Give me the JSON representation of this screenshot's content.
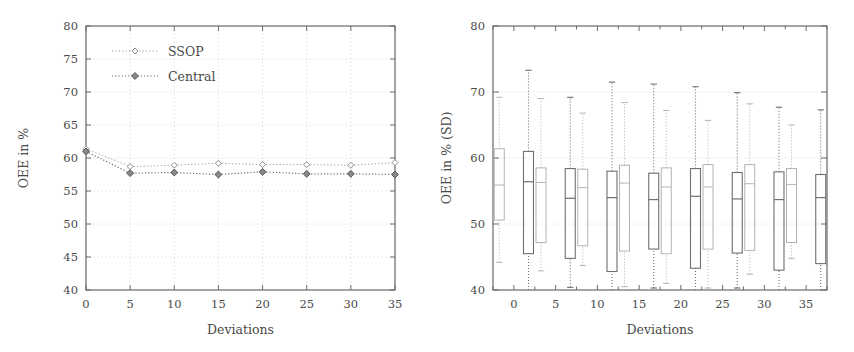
{
  "figure": {
    "background": "#ffffff",
    "panel_count": 2
  },
  "chart_data": [
    {
      "panel": "left",
      "type": "line",
      "title": "",
      "xlabel": "Deviations",
      "ylabel": "OEE in %",
      "x": [
        0,
        5,
        10,
        15,
        20,
        25,
        30,
        35
      ],
      "xticklabels": [
        "0",
        "5",
        "10",
        "15",
        "20",
        "25",
        "30",
        "35"
      ],
      "xlim": [
        0,
        35
      ],
      "ylim": [
        40,
        80
      ],
      "yticks": [
        40,
        45,
        50,
        55,
        60,
        65,
        70,
        75,
        80
      ],
      "yticklabels": [
        "40",
        "45",
        "50",
        "55",
        "60",
        "65",
        "70",
        "75",
        "80"
      ],
      "grid": true,
      "grid_style": "dotted",
      "legend_position": "upper-left",
      "series": [
        {
          "name": "SSOP",
          "color": "#9a9a96",
          "marker": "open-diamond",
          "values": [
            61.4,
            58.7,
            58.9,
            59.2,
            59.0,
            59.0,
            58.9,
            59.3
          ]
        },
        {
          "name": "Central",
          "color": "#6e6e6a",
          "marker": "filled-diamond",
          "values": [
            61.0,
            57.7,
            57.8,
            57.5,
            57.9,
            57.6,
            57.6,
            57.5
          ]
        }
      ]
    },
    {
      "panel": "right",
      "type": "boxplot",
      "title": "",
      "xlabel": "Deviations",
      "ylabel": "OEE in % (SD)",
      "categories": [
        "0",
        "5",
        "10",
        "15",
        "20",
        "25",
        "30",
        "35"
      ],
      "xlim": [
        -2.5,
        37.5
      ],
      "ylim": [
        40,
        80
      ],
      "yticks": [
        40,
        50,
        60,
        70,
        80
      ],
      "yticklabels": [
        "40",
        "50",
        "60",
        "70",
        "80"
      ],
      "grid": true,
      "grid_style": "dotted",
      "series": [
        {
          "name": "SSOP",
          "color": "#b4b4af",
          "boxes": [
            {
              "category": "0",
              "whisker_low": 44.2,
              "q1": 50.6,
              "median": 55.9,
              "q3": 61.4,
              "whisker_high": 69.2
            },
            {
              "category": "5",
              "whisker_low": 42.9,
              "q1": 47.2,
              "median": 56.3,
              "q3": 58.5,
              "whisker_high": 69.0
            },
            {
              "category": "10",
              "whisker_low": 43.7,
              "q1": 46.7,
              "median": 55.5,
              "q3": 58.3,
              "whisker_high": 66.8
            },
            {
              "category": "15",
              "whisker_low": 40.5,
              "q1": 45.9,
              "median": 56.2,
              "q3": 58.9,
              "whisker_high": 68.4
            },
            {
              "category": "20",
              "whisker_low": 41.0,
              "q1": 45.5,
              "median": 55.6,
              "q3": 58.5,
              "whisker_high": 67.2
            },
            {
              "category": "25",
              "whisker_low": 40.3,
              "q1": 46.2,
              "median": 55.6,
              "q3": 59.0,
              "whisker_high": 65.7
            },
            {
              "category": "30",
              "whisker_low": 42.4,
              "q1": 46.0,
              "median": 56.1,
              "q3": 59.0,
              "whisker_high": 68.2
            },
            {
              "category": "35",
              "whisker_low": 44.8,
              "q1": 47.2,
              "median": 56.0,
              "q3": 58.4,
              "whisker_high": 65.0
            }
          ]
        },
        {
          "name": "Central",
          "color": "#6f6f6b",
          "boxes": [
            {
              "category": "0",
              "whisker_low": 40.0,
              "q1": 45.5,
              "median": 56.4,
              "q3": 61.0,
              "whisker_high": 73.3
            },
            {
              "category": "5",
              "whisker_low": 40.4,
              "q1": 44.8,
              "median": 53.9,
              "q3": 58.4,
              "whisker_high": 69.2
            },
            {
              "category": "10",
              "whisker_low": 40.0,
              "q1": 42.8,
              "median": 54.0,
              "q3": 58.0,
              "whisker_high": 71.5
            },
            {
              "category": "15",
              "whisker_low": 40.3,
              "q1": 46.2,
              "median": 53.7,
              "q3": 57.7,
              "whisker_high": 71.2
            },
            {
              "category": "20",
              "whisker_low": 40.0,
              "q1": 43.3,
              "median": 54.2,
              "q3": 58.4,
              "whisker_high": 70.8
            },
            {
              "category": "25",
              "whisker_low": 40.3,
              "q1": 45.6,
              "median": 53.8,
              "q3": 57.8,
              "whisker_high": 69.9
            },
            {
              "category": "30",
              "whisker_low": 40.0,
              "q1": 43.0,
              "median": 53.7,
              "q3": 57.9,
              "whisker_high": 67.7
            },
            {
              "category": "35",
              "whisker_low": 40.0,
              "q1": 44.0,
              "median": 54.0,
              "q3": 57.5,
              "whisker_high": 67.3
            }
          ]
        }
      ]
    }
  ]
}
